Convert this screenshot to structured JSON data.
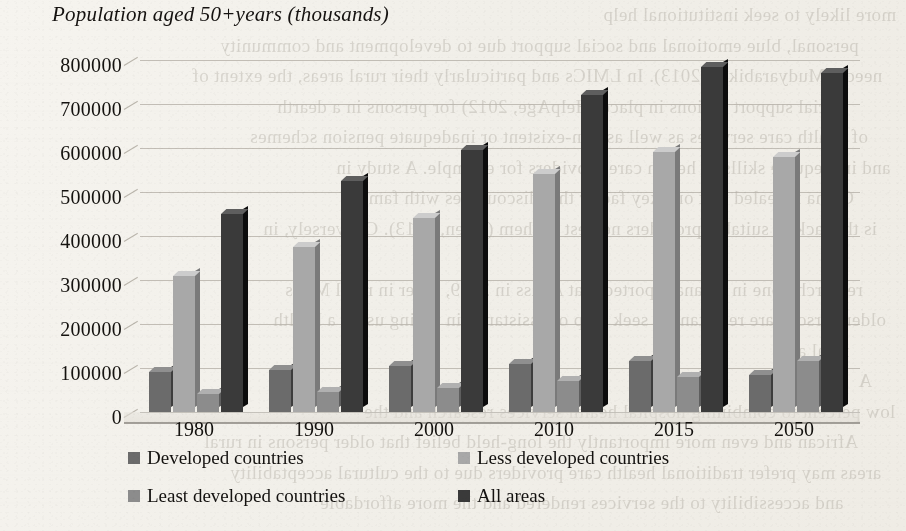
{
  "chart_data": {
    "type": "bar",
    "title": "Population aged 50+years (thousands)",
    "xlabel": "",
    "ylabel": "",
    "categories": [
      "1980",
      "1990",
      "2000",
      "2010",
      "2015",
      "2050"
    ],
    "series": [
      {
        "name": "Developed countries",
        "color": "#6b6b6b",
        "values": [
          90000,
          95000,
          105000,
          110000,
          115000,
          85000
        ]
      },
      {
        "name": "Less developed countries",
        "color": "#a8a8a8",
        "values": [
          310000,
          375000,
          440000,
          540000,
          590000,
          580000
        ]
      },
      {
        "name": "Least developed countries",
        "color": "#8c8c8c",
        "values": [
          40000,
          45000,
          55000,
          70000,
          80000,
          115000
        ]
      },
      {
        "name": "All areas",
        "color": "#3a3a3a",
        "values": [
          450000,
          525000,
          595000,
          720000,
          785000,
          770000
        ]
      }
    ],
    "yticks": [
      0,
      100000,
      200000,
      300000,
      400000,
      500000,
      600000,
      700000,
      800000
    ],
    "ytick_labels": [
      "0",
      "100000",
      "200000",
      "300000",
      "400000",
      "500000",
      "600000",
      "700000",
      "800000"
    ],
    "ylim": [
      0,
      800000
    ],
    "grid": true,
    "legend_position": "bottom",
    "style_3d": true
  },
  "legend": {
    "items": [
      {
        "label": "Developed countries",
        "color": "#6b6b6b"
      },
      {
        "label": "Less developed countries",
        "color": "#a8a8a8"
      },
      {
        "label": "Least developed countries",
        "color": "#8c8c8c"
      },
      {
        "label": "All areas",
        "color": "#3a3a3a"
      }
    ]
  },
  "page_background": {
    "bleed_text": [
      "more likely to seek institutional help",
      "personal, blue emotional and social support due to development and community",
      "needs (Mudyarabikwa 2013). In LMICs and particularly their rural areas, the extent of",
      "social support options in place (HelpAge, 2012) for persons in a dearth",
      "of health care services as well as non-existent or inadequate pension schemes",
      "and inadequate skills of health care providers for example. A study in",
      "China revealed that one key factor that discourages with family",
      "is the lack of suitable providers nearest to them (Chen, 2013). Conversely, in",
      "A",
      "research done in Ghana reported that Abass in 2009, older in rural MICs",
      "older persons are reluctant to seek help or assistance in telling using a health",
      "rural area",
      "A",
      "low percent to combining hospital health services research and the",
      "African and even more importantly the long-held belief that older persons in rural",
      "areas may prefer traditional health care providers due to the cultural acceptability",
      "and accessibility to the services rendered and the more affordable"
    ]
  }
}
